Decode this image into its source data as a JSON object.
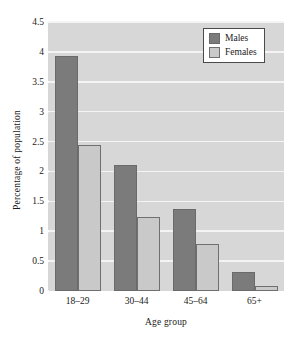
{
  "chart_data": {
    "type": "bar",
    "title": "",
    "xlabel": "Age group",
    "ylabel": "Percentage of population",
    "categories": [
      "18–29",
      "30–44",
      "45–64",
      "65+"
    ],
    "series": [
      {
        "name": "Males",
        "color": "#7b7b7b",
        "values": [
          3.93,
          2.1,
          1.38,
          0.31
        ]
      },
      {
        "name": "Females",
        "color": "#c9c9c9",
        "values": [
          2.45,
          1.24,
          0.79,
          0.09
        ]
      }
    ],
    "ylim": [
      0,
      4.5
    ],
    "yticks": [
      "0",
      "0.5",
      "1",
      "1.5",
      "2",
      "2.5",
      "3",
      "3.5",
      "4",
      "4.5"
    ],
    "ytick_values": [
      0,
      0.5,
      1,
      1.5,
      2,
      2.5,
      3,
      3.5,
      4,
      4.5
    ],
    "grid": true,
    "legend_position": "top-right",
    "plot_background": "#d7d7d7",
    "gridline_color": "#f4f4f4"
  }
}
